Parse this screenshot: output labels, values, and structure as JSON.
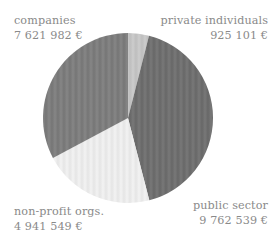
{
  "chart_data": {
    "type": "pie",
    "title": "",
    "subtitle": "",
    "xlabel": "",
    "ylabel": "",
    "grid": false,
    "legend_position": "around-slices",
    "currency_symbol": "€",
    "total": 23251171,
    "start_angle_deg": 0,
    "direction": "clockwise",
    "categories": [
      "private individuals",
      "public sector",
      "non-profit orgs.",
      "companies"
    ],
    "values": [
      925101,
      9762539,
      4941549,
      7621982
    ],
    "value_labels": [
      "925 101 €",
      "9 762 539 €",
      "4 941 549 €",
      "7 621 982 €"
    ],
    "percentages": [
      4.0,
      42.0,
      21.3,
      32.8
    ],
    "colors": [
      "#c9c9c9",
      "#6e6e6e",
      "#f2f2f2",
      "#7d7d7d"
    ],
    "slices": [
      {
        "label": "private individuals",
        "value": 925101,
        "value_label": "925 101 €",
        "percent": 4.0,
        "color": "#c9c9c9",
        "start_deg": 0,
        "end_deg": 14.3,
        "label_position": "top-right"
      },
      {
        "label": "public sector",
        "value": 9762539,
        "value_label": "9 762 539 €",
        "percent": 42.0,
        "color": "#6e6e6e",
        "start_deg": 14.3,
        "end_deg": 165.5,
        "label_position": "bottom-right"
      },
      {
        "label": "non-profit orgs.",
        "value": 4941549,
        "value_label": "4 941 549 €",
        "percent": 21.3,
        "color": "#f2f2f2",
        "start_deg": 165.5,
        "end_deg": 242.0,
        "label_position": "bottom-left"
      },
      {
        "label": "companies",
        "value": 7621982,
        "value_label": "7 621 982 €",
        "percent": 32.8,
        "color": "#7d7d7d",
        "start_deg": 242.0,
        "end_deg": 360,
        "label_position": "top-left"
      }
    ]
  },
  "labels": {
    "companies": {
      "name": "companies",
      "value": "7 621 982 €"
    },
    "private_individuals": {
      "name": "private individuals",
      "value": "925 101 €"
    },
    "public_sector": {
      "name": "public sector",
      "value": "9 762 539 €"
    },
    "non_profit": {
      "name": "non-profit orgs.",
      "value": "4 941 549 €"
    }
  },
  "style": {
    "background": "#ffffff",
    "label_color": "#8a8a8a"
  }
}
